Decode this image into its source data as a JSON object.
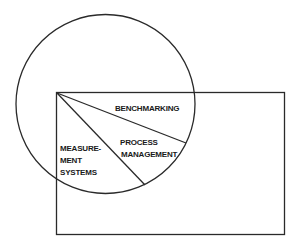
{
  "diagram": {
    "colors": {
      "stroke": "#2a2a2a",
      "text": "#1a1a1a",
      "background": "#ffffff"
    },
    "circle": {
      "cx": 105.5,
      "cy": 104,
      "r": 89.5
    },
    "rectangle": {
      "x": 56.5,
      "y": 92.5,
      "width": 228,
      "height": 142
    },
    "segments": [
      {
        "x1": 57,
        "y1": 93,
        "x2": 186,
        "y2": 143
      },
      {
        "x1": 57,
        "y1": 93,
        "x2": 145,
        "y2": 185
      }
    ],
    "labels": {
      "benchmarking": "BENCHMARKING",
      "process_line1": "PROCESS",
      "process_line2": "MANAGEMENT",
      "measurement_line1": "MEASURE-",
      "measurement_line2": "MENT",
      "measurement_line3": "SYSTEMS"
    }
  }
}
